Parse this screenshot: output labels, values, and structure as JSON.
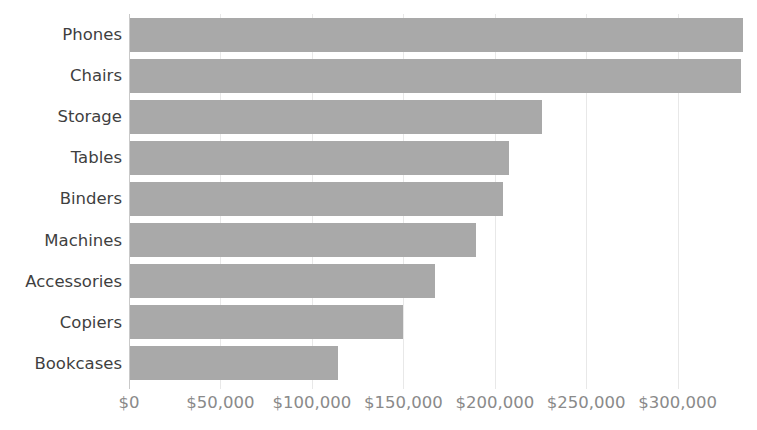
{
  "chart_data": {
    "type": "bar",
    "orientation": "horizontal",
    "title": "",
    "subtitle": "",
    "xlabel": "",
    "ylabel": "",
    "categories": [
      "Phones",
      "Chairs",
      "Storage",
      "Tables",
      "Binders",
      "Machines",
      "Accessories",
      "Copiers",
      "Bookcases"
    ],
    "values": [
      335000,
      334000,
      225000,
      207000,
      204000,
      189000,
      167000,
      149000,
      114000
    ],
    "series": [
      {
        "name": "Sales",
        "values": [
          335000,
          334000,
          225000,
          207000,
          204000,
          189000,
          167000,
          149000,
          114000
        ]
      }
    ],
    "xlim": [
      0,
      339000
    ],
    "xticks": [
      0,
      50000,
      100000,
      150000,
      200000,
      250000,
      300000
    ],
    "xtick_labels": [
      "$0",
      "$50,000",
      "$100,000",
      "$150,000",
      "$200,000",
      "$250,000",
      "$300,000"
    ],
    "grid": "vertical",
    "legend": "none",
    "sorted": "descending",
    "colors": {
      "bar_fill": "#a9a9a9",
      "gridline": "#e8e8e8",
      "axis_line": "#c9c9c9",
      "category_label": "#3f3f3f",
      "tick_label": "#8a8a8a",
      "background": "#ffffff"
    }
  }
}
